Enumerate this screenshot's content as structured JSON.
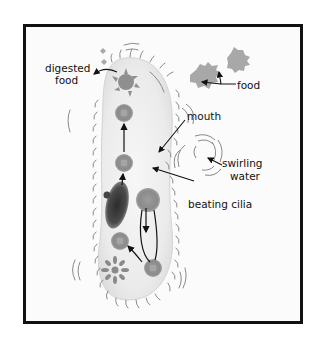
{
  "diagram": {
    "labels": {
      "digested_food_line1": "digested",
      "digested_food_line2": "food",
      "food": "food",
      "mouth": "mouth",
      "swirling_water_line1": "swirling",
      "swirling_water_line2": "water",
      "beating_cilia": "beating cilia"
    },
    "colors": {
      "frame": "#111111",
      "background": "#fbfbfb",
      "cell_body": "#ececec",
      "food_vacuole": "#8a8a8a",
      "food_particle": "#a8a8a8",
      "nucleus": "#3a3a3a",
      "cilia": "#777777",
      "arrow": "#111111"
    }
  }
}
